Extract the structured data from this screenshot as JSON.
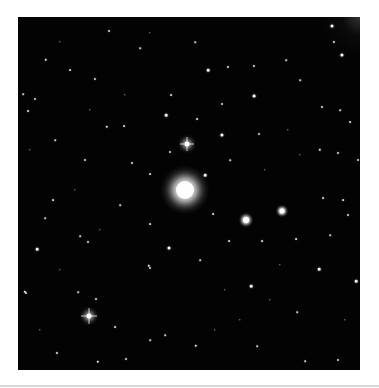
{
  "image": {
    "subject": "star field with bright elliptical galaxy",
    "background_color": "#030303",
    "page_color": "#ffffff",
    "frame": {
      "left": 18,
      "top": 17,
      "width": 342,
      "height": 353
    }
  },
  "galaxies": [
    {
      "x": 185,
      "y": 190,
      "core": 9,
      "halo": 24
    },
    {
      "x": 246,
      "y": 220,
      "core": 3,
      "halo": 7
    },
    {
      "x": 282,
      "y": 211,
      "core": 2.5,
      "halo": 6
    }
  ],
  "spiked_stars": [
    {
      "x": 187,
      "y": 144,
      "r": 2.5,
      "spike": 7
    },
    {
      "x": 89,
      "y": 316,
      "r": 2.5,
      "spike": 8
    }
  ],
  "stars": [
    [
      46,
      60,
      1.2
    ],
    [
      109,
      31,
      1
    ],
    [
      35,
      99,
      1
    ],
    [
      28,
      111,
      0.9
    ],
    [
      166,
      115,
      1.3
    ],
    [
      107,
      127,
      1.2
    ],
    [
      124,
      126,
      0.9
    ],
    [
      171,
      95,
      0.9
    ],
    [
      170,
      152,
      1
    ],
    [
      85,
      160,
      1
    ],
    [
      132,
      163,
      1
    ],
    [
      150,
      174,
      0.9
    ],
    [
      23,
      94,
      0.8
    ],
    [
      70,
      70,
      0.9
    ],
    [
      95,
      79,
      1.1
    ],
    [
      60,
      42,
      0.7
    ],
    [
      140,
      48,
      0.8
    ],
    [
      150,
      33,
      0.7
    ],
    [
      125,
      95,
      0.7
    ],
    [
      90,
      110,
      0.7
    ],
    [
      55,
      140,
      0.8
    ],
    [
      30,
      150,
      0.7
    ],
    [
      75,
      190,
      0.7
    ],
    [
      332,
      26,
      1.5
    ],
    [
      334,
      42,
      1.1
    ],
    [
      342,
      55,
      1.6
    ],
    [
      208,
      70,
      1.3
    ],
    [
      228,
      67,
      1.1
    ],
    [
      254,
      66,
      1.1
    ],
    [
      254,
      96,
      1.4
    ],
    [
      222,
      104,
      1
    ],
    [
      322,
      107,
      1
    ],
    [
      197,
      119,
      0.9
    ],
    [
      222,
      135,
      1.6
    ],
    [
      320,
      150,
      1.2
    ],
    [
      259,
      134,
      1
    ],
    [
      338,
      153,
      1
    ],
    [
      358,
      160,
      1
    ],
    [
      350,
      122,
      0.9
    ],
    [
      195,
      42,
      0.8
    ],
    [
      286,
      60,
      0.8
    ],
    [
      300,
      80,
      0.8
    ],
    [
      340,
      110,
      0.8
    ],
    [
      288,
      130,
      0.7
    ],
    [
      230,
      160,
      0.8
    ],
    [
      265,
      170,
      0.7
    ],
    [
      205,
      175,
      1.3
    ],
    [
      300,
      155,
      0.7
    ],
    [
      169,
      248,
      1.5
    ],
    [
      37,
      249,
      1.3
    ],
    [
      150,
      224,
      0.9
    ],
    [
      88,
      242,
      1
    ],
    [
      80,
      236,
      0.8
    ],
    [
      149,
      266,
      1.2
    ],
    [
      150,
      268,
      1
    ],
    [
      25,
      292,
      1.2
    ],
    [
      26,
      293,
      1
    ],
    [
      96,
      299,
      1
    ],
    [
      115,
      327,
      0.9
    ],
    [
      57,
      353,
      1.1
    ],
    [
      126,
      359,
      1
    ],
    [
      98,
      362,
      1.2
    ],
    [
      78,
      292,
      0.8
    ],
    [
      53,
      200,
      0.9
    ],
    [
      45,
      218,
      0.8
    ],
    [
      120,
      205,
      0.8
    ],
    [
      100,
      230,
      0.7
    ],
    [
      40,
      330,
      0.7
    ],
    [
      150,
      340,
      0.8
    ],
    [
      60,
      270,
      0.7
    ],
    [
      165,
      335,
      0.8
    ],
    [
      319,
      269,
      1.3
    ],
    [
      356,
      281,
      1.3
    ],
    [
      251,
      286,
      1.3
    ],
    [
      348,
      215,
      1
    ],
    [
      296,
      239,
      0.9
    ],
    [
      323,
      198,
      0.9
    ],
    [
      343,
      200,
      0.9
    ],
    [
      262,
      241,
      0.9
    ],
    [
      229,
      241,
      0.9
    ],
    [
      196,
      346,
      1.2
    ],
    [
      338,
      360,
      1
    ],
    [
      257,
      346,
      0.8
    ],
    [
      213,
      214,
      0.9
    ],
    [
      297,
      312,
      0.8
    ],
    [
      305,
      361,
      0.8
    ],
    [
      330,
      235,
      0.8
    ],
    [
      270,
      300,
      0.7
    ],
    [
      240,
      320,
      0.7
    ],
    [
      215,
      330,
      0.7
    ],
    [
      345,
      320,
      0.7
    ],
    [
      280,
      265,
      0.7
    ],
    [
      200,
      260,
      0.8
    ],
    [
      225,
      290,
      0.7
    ]
  ],
  "bottom_rule_color": "#d8d8d8"
}
